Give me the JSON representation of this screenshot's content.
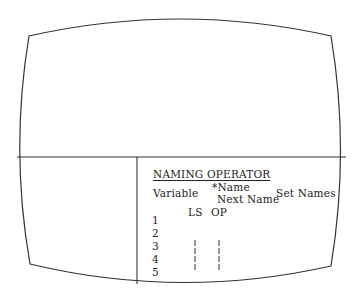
{
  "panel": {
    "title": "NAMING OPERATOR",
    "col_variable": "Variable",
    "col_name": "*Name",
    "col_next_name": "Next Name",
    "col_set_names": "Set Names",
    "sub_ls": "LS",
    "sub_op": "OP",
    "rows": [
      "1",
      "2",
      "3",
      "4",
      "5"
    ]
  },
  "colors": {
    "line": "#333333",
    "text": "#222222",
    "background": "#ffffff"
  }
}
